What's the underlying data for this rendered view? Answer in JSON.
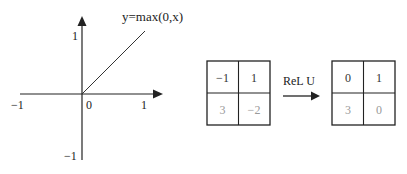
{
  "graph": {
    "function_label": "y=max(0,x)",
    "x_ticks": {
      "neg": "−1",
      "zero": "0",
      "pos": "1"
    },
    "y_ticks": {
      "pos": "1",
      "neg": "−1"
    }
  },
  "operation": {
    "label": "ReL U"
  },
  "input_matrix": {
    "cells": [
      "−1",
      "1",
      "3",
      "−2"
    ]
  },
  "output_matrix": {
    "cells": [
      "0",
      "1",
      "3",
      "0"
    ]
  },
  "colors": {
    "primary_text": "#222222",
    "faded_text": "#9a9a9a",
    "line": "#222222"
  }
}
